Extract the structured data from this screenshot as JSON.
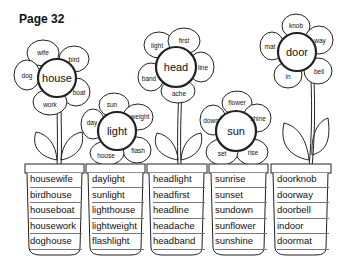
{
  "page": {
    "title": "Page 32"
  },
  "flowers": [
    {
      "center": "house",
      "petals": [
        "wife",
        "bird",
        "boat",
        "work",
        "dog"
      ],
      "words": [
        "housewife",
        "birdhouse",
        "houseboat",
        "housework",
        "doghouse"
      ]
    },
    {
      "center": "light",
      "petals": [
        "sun",
        "weight",
        "flash",
        "house",
        "day"
      ],
      "words": [
        "daylight",
        "sunlight",
        "lighthouse",
        "lightweight",
        "flashlight"
      ]
    },
    {
      "center": "head",
      "petals": [
        "first",
        "line",
        "ache",
        "band",
        "light"
      ],
      "words": [
        "headlight",
        "headfirst",
        "headline",
        "headache",
        "headband"
      ]
    },
    {
      "center": "sun",
      "petals": [
        "flower",
        "shine",
        "rise",
        "set",
        "down"
      ],
      "words": [
        "sunrise",
        "sunset",
        "sundown",
        "sunflower",
        "sunshine"
      ]
    },
    {
      "center": "door",
      "petals": [
        "knob",
        "way",
        "bell",
        "in",
        "mat"
      ],
      "words": [
        "doorknob",
        "doorway",
        "doorbell",
        "indoor",
        "doormat"
      ]
    }
  ]
}
